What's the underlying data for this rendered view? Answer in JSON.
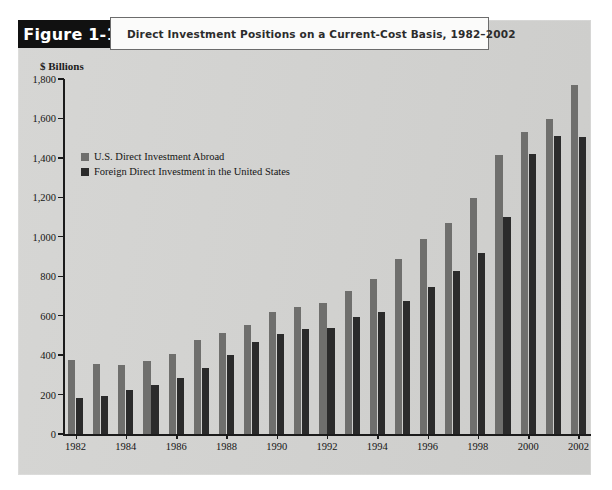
{
  "figure": {
    "tab_label": "Figure 1-1",
    "title": "Direct Investment Positions on a Current-Cost Basis, 1982–2002"
  },
  "legend": {
    "position": "inside-top-left",
    "items": [
      {
        "label": "U.S. Direct Investment Abroad",
        "color": "#6f6f6d"
      },
      {
        "label": "Foreign Direct Investment in the United States",
        "color": "#2b2b2b"
      }
    ]
  },
  "axes": {
    "y_unit_label": "$ Billions",
    "y_ticks": [
      "0",
      "200",
      "400",
      "600",
      "800",
      "1,000",
      "1,200",
      "1,400",
      "1,600",
      "1,800"
    ],
    "y_tick_values": [
      0,
      200,
      400,
      600,
      800,
      1000,
      1200,
      1400,
      1600,
      1800
    ],
    "x_ticks": [
      "1982",
      "1984",
      "1986",
      "1988",
      "1990",
      "1992",
      "1994",
      "1996",
      "1998",
      "2000",
      "2002"
    ]
  },
  "chart_data": {
    "type": "bar",
    "title": "Direct Investment Positions on a Current-Cost Basis, 1982–2002",
    "xlabel": "",
    "ylabel": "$ Billions",
    "ylim": [
      0,
      1800
    ],
    "ytick_step": 200,
    "grid": false,
    "legend_position": "inside-top-left",
    "categories": [
      "1982",
      "1983",
      "1984",
      "1985",
      "1986",
      "1987",
      "1988",
      "1989",
      "1990",
      "1991",
      "1992",
      "1993",
      "1994",
      "1995",
      "1996",
      "1997",
      "1998",
      "1999",
      "2000",
      "2001",
      "2002"
    ],
    "series": [
      {
        "name": "U.S. Direct Investment Abroad",
        "color": "#6f6f6d",
        "values": [
          374,
          355,
          348,
          372,
          405,
          478,
          513,
          553,
          617,
          643,
          664,
          723,
          787,
          885,
          990,
          1069,
          1196,
          1415,
          1532,
          1598,
          1770
        ]
      },
      {
        "name": "Foreign Direct Investment in the United States",
        "color": "#2b2b2b",
        "values": [
          185,
          194,
          224,
          248,
          285,
          334,
          402,
          468,
          505,
          534,
          540,
          594,
          618,
          673,
          745,
          825,
          920,
          1101,
          1421,
          1509,
          1505
        ]
      }
    ]
  },
  "colors": {
    "panel_background": "#d3d3d1",
    "tab_background": "#111111",
    "tab_text": "#ffffff",
    "title_background": "#fbfbfa",
    "axis": "#1b1b1b",
    "series_a": "#6f6f6d",
    "series_b": "#2b2b2b"
  }
}
